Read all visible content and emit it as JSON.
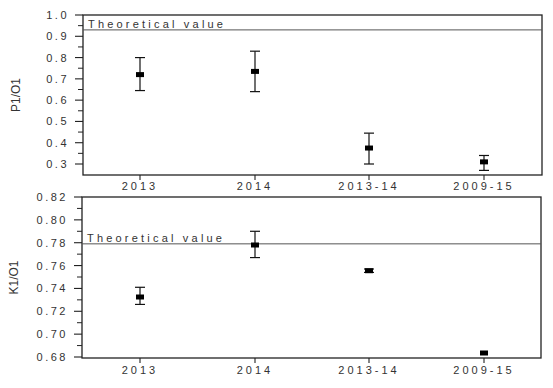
{
  "chart_data": [
    {
      "type": "scatter",
      "title": "",
      "xlabel": "",
      "ylabel": "P1/O1",
      "categories": [
        "2013",
        "2014",
        "2013-14",
        "2009-15"
      ],
      "series": [
        {
          "name": "P1/O1 ratio",
          "values": [
            0.72,
            0.735,
            0.375,
            0.31
          ],
          "error_low": [
            0.645,
            0.64,
            0.3,
            0.27
          ],
          "error_high": [
            0.8,
            0.83,
            0.445,
            0.34
          ]
        }
      ],
      "reference_line": {
        "label": "Theoretical value",
        "value": 0.93
      },
      "ylim": [
        0.25,
        1.0
      ],
      "yticks": [
        "1.0",
        "0.9",
        "0.8",
        "0.7",
        "0.6",
        "0.5",
        "0.4",
        "0.3"
      ],
      "ytick_values": [
        1.0,
        0.9,
        0.8,
        0.7,
        0.6,
        0.5,
        0.4,
        0.3
      ],
      "grid": false,
      "legend": null
    },
    {
      "type": "scatter",
      "title": "",
      "xlabel": "",
      "ylabel": "K1/O1",
      "categories": [
        "2013",
        "2014",
        "2013-14",
        "2009-15"
      ],
      "series": [
        {
          "name": "K1/O1 ratio",
          "values": [
            0.7325,
            0.778,
            0.7555,
            0.6835
          ],
          "error_low": [
            0.726,
            0.767,
            0.754,
            0.683
          ],
          "error_high": [
            0.741,
            0.79,
            0.757,
            0.684
          ]
        }
      ],
      "reference_line": {
        "label": "Theoretical value",
        "value": 0.779
      },
      "ylim": [
        0.68,
        0.82
      ],
      "yticks": [
        "0.82",
        "0.80",
        "0.78",
        "0.76",
        "0.74",
        "0.72",
        "0.70",
        "0.68"
      ],
      "ytick_values": [
        0.82,
        0.8,
        0.78,
        0.76,
        0.74,
        0.72,
        0.7,
        0.68
      ],
      "grid": false,
      "legend": null
    }
  ],
  "panels": [
    {
      "ylabel": "P1/O1",
      "ref_label": "Theoretical value"
    },
    {
      "ylabel": "K1/O1",
      "ref_label": "Theoretical value"
    }
  ]
}
